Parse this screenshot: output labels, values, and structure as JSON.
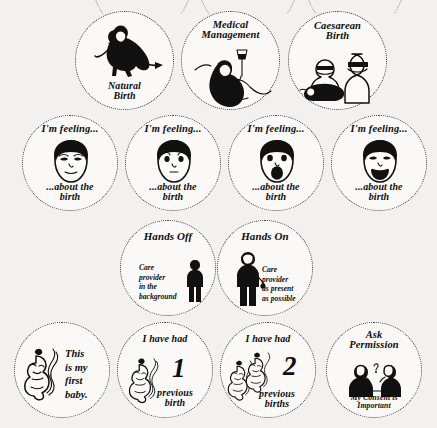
{
  "sheet": {
    "title": "Birth preference sticker badges",
    "background_color": "#f3f1ef",
    "ink_color": "#111111",
    "badge_fill": "#faf9f8",
    "border_style": "dotted"
  },
  "rows": [
    {
      "name": "birth-type",
      "badges": [
        {
          "id": "natural-birth",
          "caption_bottom": "Natural\nBirth",
          "icon": "kneeling-pregnant-person-icon"
        },
        {
          "id": "medical-management",
          "caption_top": "Medical\nManagement",
          "icon": "reclining-person-with-iv-drip-icon"
        },
        {
          "id": "caesarean-birth",
          "caption_top": "Caesarean\nBirth",
          "icon": "two-masked-surgeons-icon"
        }
      ]
    },
    {
      "name": "feelings",
      "badges": [
        {
          "id": "feeling-calm",
          "caption_top": "I'm feeling...",
          "caption_bottom": "...about the\nbirth",
          "icon": "calm-face-icon"
        },
        {
          "id": "feeling-worried",
          "caption_top": "I'm feeling...",
          "caption_bottom": "...about the\nbirth",
          "icon": "worried-face-icon"
        },
        {
          "id": "feeling-shocked",
          "caption_top": "I'm feeling...",
          "caption_bottom": "...about the\nbirth",
          "icon": "shocked-face-icon"
        },
        {
          "id": "feeling-happy",
          "caption_top": "I'm feeling...",
          "caption_bottom": "...about the\nbirth",
          "icon": "happy-face-icon"
        }
      ]
    },
    {
      "name": "care-provider-style",
      "badges": [
        {
          "id": "hands-off",
          "caption_top": "Hands Off",
          "side_text": "Care\nprovider\nin the\nbackground",
          "icon": "standing-care-provider-icon"
        },
        {
          "id": "hands-on",
          "caption_top": "Hands On",
          "side_text": "Care\nprovider\nas present\nas possible",
          "icon": "care-provider-holding-hand-icon"
        }
      ]
    },
    {
      "name": "birth-history",
      "badges": [
        {
          "id": "first-baby",
          "side_text": "This\nis my\nfirst\nbaby.",
          "icon": "fetus-icon"
        },
        {
          "id": "one-previous-birth",
          "caption_top": "I have had",
          "number": "1",
          "caption_bottom": "previous\nbirth",
          "icon": "fetus-icon"
        },
        {
          "id": "two-previous-births",
          "caption_top": "I have had",
          "number": "2",
          "caption_bottom": "previous\nbirths",
          "icon": "two-fetuses-icon"
        },
        {
          "id": "ask-permission",
          "caption_top": "Ask\nPermission",
          "caption_bottom": "My Consent is\nImportant",
          "icon": "two-people-talking-icon"
        }
      ]
    }
  ]
}
